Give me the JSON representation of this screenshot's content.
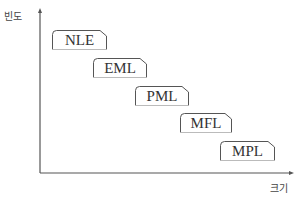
{
  "axes": {
    "y_label": "빈도",
    "x_label": "크기"
  },
  "boxes": [
    {
      "label": "NLE"
    },
    {
      "label": "EML"
    },
    {
      "label": "PML"
    },
    {
      "label": "MFL"
    },
    {
      "label": "MPL"
    }
  ],
  "colors": {
    "axis": "#555555",
    "box_border": "#555555"
  }
}
